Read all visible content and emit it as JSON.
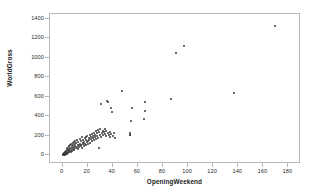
{
  "chart_data": {
    "type": "scatter",
    "title": "",
    "xlabel": "OpeningWeekend",
    "ylabel": "WorldGross",
    "xlim": [
      -10,
      190
    ],
    "ylim": [
      -90,
      1450
    ],
    "xticks": [
      0,
      20,
      40,
      60,
      80,
      100,
      120,
      140,
      160,
      180
    ],
    "yticks": [
      0,
      200,
      400,
      600,
      800,
      1000,
      1200,
      1400
    ],
    "grid": false,
    "legend": null,
    "marker_color": "#3a3a3a",
    "frame_color": "#b9b9b9",
    "points": [
      [
        0.4,
        5
      ],
      [
        0.6,
        10
      ],
      [
        0.8,
        3
      ],
      [
        1.0,
        14
      ],
      [
        1.2,
        8
      ],
      [
        1.5,
        20
      ],
      [
        1.6,
        6
      ],
      [
        1.8,
        30
      ],
      [
        2.0,
        12
      ],
      [
        2.2,
        25
      ],
      [
        2.4,
        45
      ],
      [
        2.6,
        18
      ],
      [
        2.8,
        9
      ],
      [
        3.0,
        35
      ],
      [
        3.2,
        55
      ],
      [
        3.4,
        22
      ],
      [
        3.6,
        70
      ],
      [
        3.8,
        16
      ],
      [
        4.0,
        40
      ],
      [
        4.2,
        60
      ],
      [
        4.5,
        28
      ],
      [
        4.8,
        85
      ],
      [
        5.0,
        50
      ],
      [
        5.2,
        33
      ],
      [
        5.5,
        95
      ],
      [
        5.8,
        65
      ],
      [
        6.0,
        44
      ],
      [
        6.2,
        110
      ],
      [
        6.5,
        75
      ],
      [
        6.8,
        38
      ],
      [
        7.0,
        120
      ],
      [
        7.2,
        58
      ],
      [
        7.5,
        90
      ],
      [
        7.8,
        48
      ],
      [
        8.0,
        130
      ],
      [
        8.2,
        70
      ],
      [
        8.5,
        105
      ],
      [
        8.8,
        55
      ],
      [
        9.0,
        140
      ],
      [
        9.2,
        80
      ],
      [
        9.5,
        62
      ],
      [
        9.8,
        115
      ],
      [
        10.0,
        95
      ],
      [
        10.3,
        150
      ],
      [
        10.6,
        72
      ],
      [
        11.0,
        125
      ],
      [
        11.3,
        88
      ],
      [
        11.6,
        160
      ],
      [
        12.0,
        100
      ],
      [
        12.3,
        68
      ],
      [
        12.6,
        135
      ],
      [
        13.0,
        110
      ],
      [
        13.3,
        82
      ],
      [
        13.6,
        170
      ],
      [
        14.0,
        120
      ],
      [
        14.3,
        95
      ],
      [
        14.6,
        145
      ],
      [
        15.0,
        105
      ],
      [
        15.3,
        78
      ],
      [
        15.6,
        185
      ],
      [
        16.0,
        130
      ],
      [
        16.3,
        112
      ],
      [
        16.6,
        155
      ],
      [
        17.0,
        98
      ],
      [
        17.3,
        140
      ],
      [
        17.6,
        175
      ],
      [
        18.0,
        120
      ],
      [
        18.3,
        190
      ],
      [
        18.6,
        108
      ],
      [
        19.0,
        160
      ],
      [
        19.3,
        135
      ],
      [
        19.6,
        200
      ],
      [
        20.0,
        145
      ],
      [
        20.4,
        118
      ],
      [
        20.8,
        178
      ],
      [
        21.2,
        155
      ],
      [
        21.6,
        205
      ],
      [
        22.0,
        130
      ],
      [
        22.4,
        190
      ],
      [
        22.8,
        165
      ],
      [
        23.2,
        215
      ],
      [
        23.6,
        145
      ],
      [
        24.0,
        200
      ],
      [
        24.4,
        175
      ],
      [
        24.8,
        230
      ],
      [
        25.2,
        160
      ],
      [
        25.6,
        210
      ],
      [
        26.0,
        185
      ],
      [
        26.4,
        245
      ],
      [
        26.8,
        170
      ],
      [
        27.2,
        225
      ],
      [
        27.6,
        195
      ],
      [
        28.0,
        260
      ],
      [
        28.4,
        180
      ],
      [
        28.8,
        75
      ],
      [
        29.2,
        240
      ],
      [
        29.6,
        205
      ],
      [
        30.0,
        265
      ],
      [
        30.5,
        190
      ],
      [
        31.0,
        530
      ],
      [
        31.5,
        225
      ],
      [
        32.0,
        250
      ],
      [
        32.5,
        205
      ],
      [
        33.0,
        235
      ],
      [
        33.5,
        270
      ],
      [
        34.0,
        215
      ],
      [
        34.5,
        195
      ],
      [
        35.0,
        250
      ],
      [
        35.5,
        560
      ],
      [
        36.0,
        230
      ],
      [
        36.5,
        545
      ],
      [
        37.0,
        205
      ],
      [
        37.5,
        185
      ],
      [
        38.0,
        240
      ],
      [
        38.5,
        220
      ],
      [
        39.0,
        480
      ],
      [
        39.5,
        440
      ],
      [
        40.0,
        195
      ],
      [
        41.0,
        225
      ],
      [
        42.0,
        180
      ],
      [
        47.5,
        655
      ],
      [
        53.5,
        210
      ],
      [
        53.8,
        225
      ],
      [
        54.0,
        205
      ],
      [
        54.5,
        355
      ],
      [
        55.0,
        480
      ],
      [
        64.5,
        375
      ],
      [
        65.5,
        450
      ],
      [
        66.0,
        550
      ],
      [
        86.5,
        580
      ],
      [
        90.0,
        1045
      ],
      [
        97.0,
        1120
      ],
      [
        137.0,
        635
      ],
      [
        169.0,
        1325
      ]
    ]
  }
}
